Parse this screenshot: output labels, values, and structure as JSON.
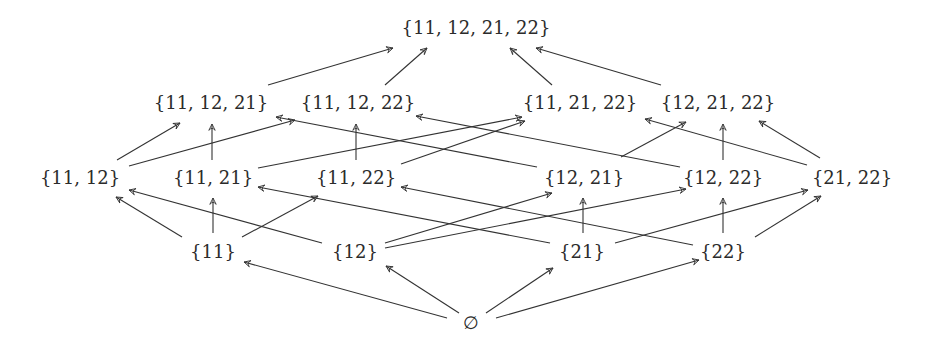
{
  "diagram": {
    "type": "hasse-diagram",
    "line_color": "#333333",
    "text_color": "#2b2b2b",
    "nodes": [
      {
        "id": "top",
        "label": "{11, 12, 21, 22}",
        "x": 476,
        "y": 28
      },
      {
        "id": "a1",
        "label": "{11, 12, 21}",
        "x": 211,
        "y": 103
      },
      {
        "id": "a2",
        "label": "{11, 12, 22}",
        "x": 358,
        "y": 103
      },
      {
        "id": "a3",
        "label": "{11, 21, 22}",
        "x": 580,
        "y": 103
      },
      {
        "id": "a4",
        "label": "{12, 21, 22}",
        "x": 718,
        "y": 103
      },
      {
        "id": "b1",
        "label": "{11, 12}",
        "x": 80,
        "y": 178
      },
      {
        "id": "b2",
        "label": "{11, 21}",
        "x": 213,
        "y": 178
      },
      {
        "id": "b3",
        "label": "{11, 22}",
        "x": 356,
        "y": 178
      },
      {
        "id": "b4",
        "label": "{12, 21}",
        "x": 584,
        "y": 178
      },
      {
        "id": "b5",
        "label": "{12, 22}",
        "x": 723,
        "y": 178
      },
      {
        "id": "b6",
        "label": "{21, 22}",
        "x": 852,
        "y": 178
      },
      {
        "id": "c1",
        "label": "{11}",
        "x": 213,
        "y": 252
      },
      {
        "id": "c2",
        "label": "{12}",
        "x": 355,
        "y": 252
      },
      {
        "id": "c3",
        "label": "{21}",
        "x": 582,
        "y": 252
      },
      {
        "id": "c4",
        "label": "{22}",
        "x": 723,
        "y": 252
      },
      {
        "id": "empty",
        "label": "∅",
        "x": 471,
        "y": 323
      }
    ],
    "edges": [
      {
        "from": "empty",
        "to": "c1",
        "x1": 447,
        "y1": 318,
        "x2": 244,
        "y2": 262
      },
      {
        "from": "empty",
        "to": "c2",
        "x1": 459,
        "y1": 313,
        "x2": 386,
        "y2": 266
      },
      {
        "from": "empty",
        "to": "c3",
        "x1": 486,
        "y1": 313,
        "x2": 553,
        "y2": 268
      },
      {
        "from": "empty",
        "to": "c4",
        "x1": 496,
        "y1": 318,
        "x2": 699,
        "y2": 260
      },
      {
        "from": "c1",
        "to": "b1",
        "x1": 182,
        "y1": 237,
        "x2": 116,
        "y2": 197
      },
      {
        "from": "c1",
        "to": "b2",
        "x1": 213,
        "y1": 233,
        "x2": 213,
        "y2": 198
      },
      {
        "from": "c1",
        "to": "b3",
        "x1": 242,
        "y1": 237,
        "x2": 318,
        "y2": 196
      },
      {
        "from": "c2",
        "to": "b1",
        "x1": 322,
        "y1": 243,
        "x2": 129,
        "y2": 190
      },
      {
        "from": "c2",
        "to": "b4",
        "x1": 385,
        "y1": 243,
        "x2": 552,
        "y2": 193
      },
      {
        "from": "c2",
        "to": "b5",
        "x1": 385,
        "y1": 248,
        "x2": 686,
        "y2": 189
      },
      {
        "from": "c3",
        "to": "b2",
        "x1": 550,
        "y1": 243,
        "x2": 258,
        "y2": 187
      },
      {
        "from": "c3",
        "to": "b4",
        "x1": 583,
        "y1": 233,
        "x2": 583,
        "y2": 198
      },
      {
        "from": "c3",
        "to": "b6",
        "x1": 615,
        "y1": 243,
        "x2": 808,
        "y2": 190
      },
      {
        "from": "c4",
        "to": "b3",
        "x1": 693,
        "y1": 245,
        "x2": 401,
        "y2": 187
      },
      {
        "from": "c4",
        "to": "b5",
        "x1": 723,
        "y1": 233,
        "x2": 723,
        "y2": 198
      },
      {
        "from": "c4",
        "to": "b6",
        "x1": 755,
        "y1": 237,
        "x2": 821,
        "y2": 196
      },
      {
        "from": "b1",
        "to": "a1",
        "x1": 117,
        "y1": 160,
        "x2": 180,
        "y2": 123
      },
      {
        "from": "b1",
        "to": "a2",
        "x1": 129,
        "y1": 166,
        "x2": 295,
        "y2": 120
      },
      {
        "from": "b2",
        "to": "a1",
        "x1": 212,
        "y1": 160,
        "x2": 212,
        "y2": 124
      },
      {
        "from": "b2",
        "to": "a3",
        "x1": 258,
        "y1": 168,
        "x2": 522,
        "y2": 117
      },
      {
        "from": "b3",
        "to": "a2",
        "x1": 356,
        "y1": 160,
        "x2": 356,
        "y2": 124
      },
      {
        "from": "b3",
        "to": "a3",
        "x1": 401,
        "y1": 164,
        "x2": 525,
        "y2": 121
      },
      {
        "from": "b4",
        "to": "a1",
        "x1": 537,
        "y1": 167,
        "x2": 276,
        "y2": 117
      },
      {
        "from": "b4",
        "to": "a4",
        "x1": 621,
        "y1": 157,
        "x2": 686,
        "y2": 122
      },
      {
        "from": "b5",
        "to": "a2",
        "x1": 680,
        "y1": 167,
        "x2": 416,
        "y2": 116
      },
      {
        "from": "b5",
        "to": "a4",
        "x1": 723,
        "y1": 160,
        "x2": 723,
        "y2": 124
      },
      {
        "from": "b6",
        "to": "a3",
        "x1": 807,
        "y1": 165,
        "x2": 645,
        "y2": 119
      },
      {
        "from": "b6",
        "to": "a4",
        "x1": 820,
        "y1": 158,
        "x2": 759,
        "y2": 121
      },
      {
        "from": "a1",
        "to": "top",
        "x1": 268,
        "y1": 85,
        "x2": 393,
        "y2": 48
      },
      {
        "from": "a2",
        "to": "top",
        "x1": 385,
        "y1": 85,
        "x2": 427,
        "y2": 48
      },
      {
        "from": "a3",
        "to": "top",
        "x1": 552,
        "y1": 85,
        "x2": 510,
        "y2": 48
      },
      {
        "from": "a4",
        "to": "top",
        "x1": 661,
        "y1": 85,
        "x2": 536,
        "y2": 48
      }
    ]
  }
}
